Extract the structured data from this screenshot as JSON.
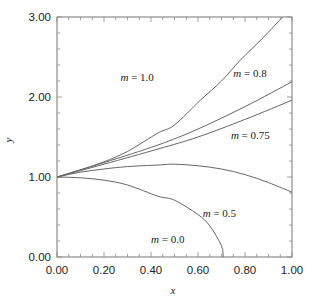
{
  "chart_data": {
    "type": "line",
    "title": "",
    "xlabel": "x",
    "ylabel": "y",
    "xlim": [
      0.0,
      1.0
    ],
    "ylim": [
      0.0,
      3.0
    ],
    "grid": false,
    "legend": "inline curve labels",
    "x_ticks": [
      "0.00",
      "0.20",
      "0.40",
      "0.60",
      "0.80",
      "1.00"
    ],
    "y_ticks": [
      "0.00",
      "1.00",
      "2.00",
      "3.00"
    ],
    "series": [
      {
        "name": "m = 1.0",
        "label_m": "m",
        "label_val": " = 1.0",
        "label_pos": [
          0.27,
          2.2
        ],
        "x": [
          0.0,
          0.1,
          0.2,
          0.3,
          0.43,
          0.5,
          0.61,
          0.7,
          0.78,
          0.88,
          0.96
        ],
        "y": [
          1.0,
          1.09,
          1.19,
          1.32,
          1.55,
          1.65,
          1.96,
          2.2,
          2.46,
          2.75,
          3.0
        ]
      },
      {
        "name": "m = 0.8",
        "label_m": "m",
        "label_val": " = 0.8",
        "label_pos": [
          0.75,
          2.25
        ],
        "x": [
          0.0,
          0.2,
          0.43,
          0.6,
          0.8,
          1.0
        ],
        "y": [
          1.0,
          1.18,
          1.4,
          1.6,
          1.88,
          2.19
        ]
      },
      {
        "name": "m = 0.75",
        "label_m": "m",
        "label_val": " = 0.75",
        "label_pos": [
          0.74,
          1.47
        ],
        "x": [
          0.0,
          0.2,
          0.43,
          0.6,
          0.8,
          1.0
        ],
        "y": [
          1.0,
          1.16,
          1.35,
          1.5,
          1.72,
          1.96
        ]
      },
      {
        "name": "m = 0.5",
        "label_m": "m",
        "label_val": " = 0.5",
        "label_pos": [
          0.62,
          0.5
        ],
        "x": [
          0.0,
          0.1,
          0.2,
          0.3,
          0.43,
          0.5,
          0.6,
          0.7,
          0.8,
          0.9,
          1.0
        ],
        "y": [
          1.0,
          1.06,
          1.1,
          1.13,
          1.15,
          1.16,
          1.14,
          1.1,
          1.03,
          0.93,
          0.81
        ]
      },
      {
        "name": "m = 0.0",
        "label_m": "m",
        "label_val": " = 0.0",
        "label_pos": [
          0.4,
          0.18
        ],
        "x": [
          0.0,
          0.1,
          0.2,
          0.3,
          0.43,
          0.5,
          0.6,
          0.65,
          0.7,
          0.707
        ],
        "y": [
          1.0,
          0.99,
          0.96,
          0.9,
          0.76,
          0.71,
          0.53,
          0.39,
          0.14,
          0.0
        ]
      }
    ]
  },
  "plot_box": {
    "left": 57,
    "right": 292,
    "top": 17,
    "bottom": 257
  }
}
